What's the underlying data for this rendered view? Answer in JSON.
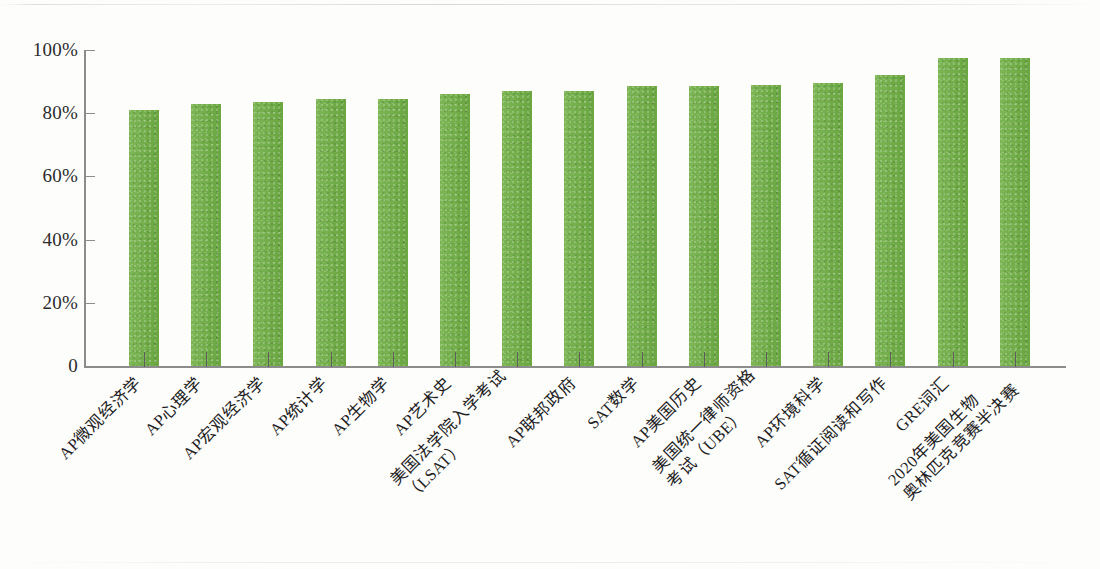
{
  "chart_data": {
    "type": "bar",
    "title": "",
    "subtitle": "",
    "xlabel": "",
    "ylabel": "",
    "ylim": [
      0,
      100
    ],
    "yticks": [
      "0",
      "20%",
      "40%",
      "60%",
      "80%",
      "100%"
    ],
    "ytick_values": [
      0,
      20,
      40,
      60,
      80,
      100
    ],
    "grid": false,
    "legend": "none",
    "bar_color": "#6eae43",
    "axis_color": "#8c8c8c",
    "categories": [
      "AP微观经济学",
      "AP心理学",
      "AP宏观经济学",
      "AP统计学",
      "AP生物学",
      "AP艺术史",
      "美国法学院入学考试（LSAT）",
      "AP联邦政府",
      "SAT数学",
      "AP美国历史",
      "美国统一律师资格考试（UBE）",
      "AP环境科学",
      "SAT循证阅读和写作",
      "GRE词汇",
      "2020年美国生物奥林匹克竞赛半决赛"
    ],
    "category_lines": [
      [
        "AP微观经济学"
      ],
      [
        "AP心理学"
      ],
      [
        "AP宏观经济学"
      ],
      [
        "AP统计学"
      ],
      [
        "AP生物学"
      ],
      [
        "AP艺术史"
      ],
      [
        "美国法学院入学考试",
        "（LSAT）"
      ],
      [
        "AP联邦政府"
      ],
      [
        "SAT数学"
      ],
      [
        "AP美国历史"
      ],
      [
        "美国统一律师资格",
        "考试（UBE）"
      ],
      [
        "AP环境科学"
      ],
      [
        "SAT循证阅读和写作"
      ],
      [
        "GRE词汇"
      ],
      [
        "2020年美国生物",
        "奥林匹克竞赛半决赛"
      ]
    ],
    "values": [
      81,
      83,
      83.5,
      84.5,
      84.5,
      86,
      87,
      87,
      88.5,
      88.5,
      89,
      89.5,
      92,
      97.5,
      97.5
    ],
    "value_labels": [
      "81%",
      "83%",
      "83.5%",
      "84.5%",
      "84.5%",
      "86%",
      "87%",
      "87%",
      "88.5%",
      "88.5%",
      "89%",
      "89.5%",
      "92%",
      "97.5%",
      "97.5%"
    ]
  }
}
